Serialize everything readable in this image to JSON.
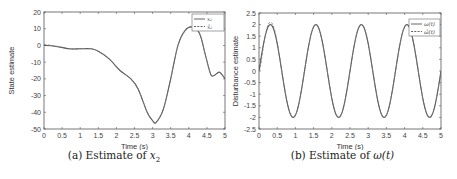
{
  "figures": [
    {
      "id": "a",
      "caption_prefix": "(a) Estimate of ",
      "caption_math": "x",
      "caption_sub": "2",
      "xlabel": "Time (s)",
      "ylabel": "State estimate",
      "legend": [
        {
          "label": "x₂",
          "style": "solid"
        },
        {
          "label": "x̂₂",
          "style": "dashed"
        }
      ]
    },
    {
      "id": "b",
      "caption_prefix": "(b) Estimate of ",
      "caption_math": "ω(t)",
      "caption_sub": "",
      "xlabel": "Time (s)",
      "ylabel": "Disturbance estimate",
      "legend": [
        {
          "label": "ω(t)",
          "style": "solid"
        },
        {
          "label": "ω̂(t)",
          "style": "dashed"
        }
      ]
    }
  ],
  "chart_data": [
    {
      "type": "line",
      "title": "(a) Estimate of x2",
      "xlabel": "Time (s)",
      "ylabel": "State estimate",
      "xlim": [
        0,
        5
      ],
      "ylim": [
        -50,
        20
      ],
      "xticks": [
        0,
        0.5,
        1,
        1.5,
        2,
        2.5,
        3,
        3.5,
        4,
        4.5,
        5
      ],
      "yticks": [
        -50,
        -40,
        -30,
        -20,
        -10,
        0,
        10,
        20
      ],
      "grid": false,
      "legend_position": "upper right",
      "x": [
        0,
        0.3,
        0.7,
        1.0,
        1.3,
        1.5,
        1.8,
        2.1,
        2.4,
        2.6,
        2.85,
        3.0,
        3.1,
        3.3,
        3.5,
        3.7,
        3.9,
        4.1,
        4.3,
        4.45,
        4.6,
        4.7,
        4.85,
        5.0
      ],
      "series": [
        {
          "name": "x2",
          "style": "solid",
          "values": [
            0,
            -0.5,
            -2,
            -2,
            -2,
            -3.5,
            -8,
            -15,
            -20,
            -26,
            -40,
            -45,
            -46,
            -38,
            -20,
            0,
            9,
            11,
            7,
            -5,
            -17,
            -18,
            -16,
            -20
          ]
        },
        {
          "name": "x2_hat",
          "style": "dashed",
          "values": [
            0.5,
            -0.3,
            -2,
            -2,
            -2,
            -3.5,
            -8,
            -15,
            -20,
            -26,
            -40,
            -45,
            -46,
            -38,
            -20,
            0,
            9,
            11,
            7,
            -5,
            -17,
            -18,
            -16,
            -20
          ]
        }
      ]
    },
    {
      "type": "line",
      "title": "(b) Estimate of ω(t)",
      "xlabel": "Time (s)",
      "ylabel": "Disturbance estimate",
      "xlim": [
        0,
        5
      ],
      "ylim": [
        -2.5,
        2.5
      ],
      "xticks": [
        0,
        0.5,
        1,
        1.5,
        2,
        2.5,
        3,
        3.5,
        4,
        4.5,
        5
      ],
      "yticks": [
        -2.5,
        -2,
        -1.5,
        -1,
        -0.5,
        0,
        0.5,
        1,
        1.5,
        2,
        2.5
      ],
      "grid": false,
      "legend_position": "upper right",
      "x": [
        0,
        0.31,
        0.93,
        1.56,
        2.18,
        2.81,
        3.43,
        4.06,
        4.68,
        5.0
      ],
      "series": [
        {
          "name": "ω(t)",
          "style": "solid",
          "values": [
            0,
            2,
            -2,
            2,
            -2,
            2,
            -2,
            2,
            -2,
            -0.2
          ]
        },
        {
          "name": "ω̂(t)",
          "style": "dashed",
          "values": [
            0,
            2.1,
            -2,
            2,
            -2,
            2,
            -2,
            2,
            -2,
            -0.2
          ]
        }
      ]
    }
  ]
}
